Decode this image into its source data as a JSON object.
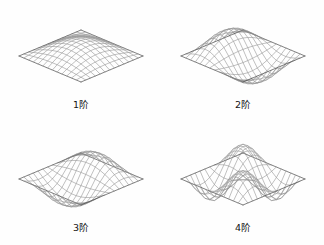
{
  "figure": {
    "title": "",
    "background_color": "#fefefe",
    "mesh_color": "#8c8c8c",
    "accent_color": "#4a4a4a",
    "label_color": "#141414",
    "columns": 2,
    "rows": 2
  },
  "chart_data": {
    "type": "surface-mesh-grid",
    "title": "",
    "subtitle": "",
    "xlabel": "",
    "ylabel": "",
    "zlabel": "",
    "grid": false,
    "legend": null,
    "projection": "isometric",
    "mesh_divisions": 13,
    "domain": {
      "u": [
        0,
        1
      ],
      "v": [
        0,
        1
      ]
    },
    "panels": [
      {
        "label": "1阶",
        "order": 1,
        "mode_x": 1,
        "mode_y": 1,
        "amplitude": 0.3,
        "description": "single central dome, all edges pinned"
      },
      {
        "label": "2阶",
        "order": 2,
        "mode_x": 2,
        "mode_y": 1,
        "amplitude": 0.42,
        "description": "anti-symmetric ridge and trough along x"
      },
      {
        "label": "3阶",
        "order": 3,
        "mode_x": 1,
        "mode_y": 2,
        "amplitude": 0.42,
        "description": "anti-symmetric ridge and trough along y"
      },
      {
        "label": "4阶",
        "order": 4,
        "mode_x": 2,
        "mode_y": 2,
        "amplitude": 0.46,
        "description": "four-lobe saddle with raised centre"
      }
    ]
  }
}
